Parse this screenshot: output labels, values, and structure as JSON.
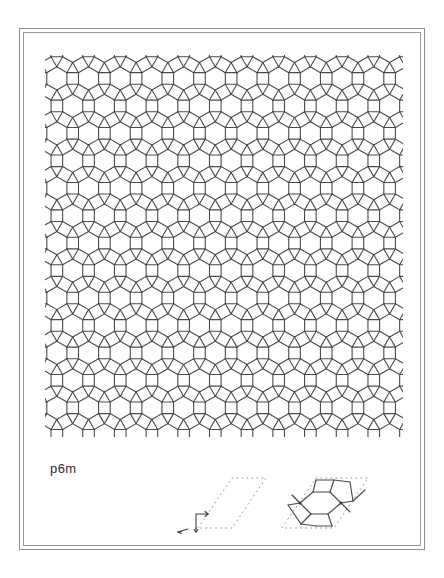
{
  "page": {
    "background_color": "#ffffff",
    "frame_color": "#8d8d8d",
    "ink_color": "#4a4a4a",
    "dotted_color": "#808080"
  },
  "plate": {
    "label": "p6m",
    "tiling_name": "rhombitrihexagonal",
    "vertex_configuration": "3.4.6.4",
    "description": "Semiregular tiling of hexagons, squares and triangles",
    "line_color": "#4a4a4a",
    "line_width": 1.1,
    "columns": 7,
    "rows": 6,
    "cell_width": 58,
    "cell_height": 67
  },
  "legend": {
    "unit_cell": {
      "name": "unit-cell-rhombus",
      "style": "dotted",
      "angle_degrees": 60,
      "axis_marker": "corner-axes",
      "arrow": "translation-vector"
    },
    "motif": {
      "name": "motif-in-unit-cell",
      "style": "solid-on-dotted-rhombus",
      "contents": "hexagon-square-triangle fragment"
    }
  },
  "chart_data": {
    "type": "diagram",
    "title": "p6m",
    "tile_types": [
      "hexagon",
      "square",
      "triangle"
    ],
    "symmetry": {
      "group": "p6m",
      "rotation_orders": [
        6,
        3,
        2
      ],
      "mirrors": true,
      "glides": true,
      "lattice": "hexagonal"
    }
  }
}
